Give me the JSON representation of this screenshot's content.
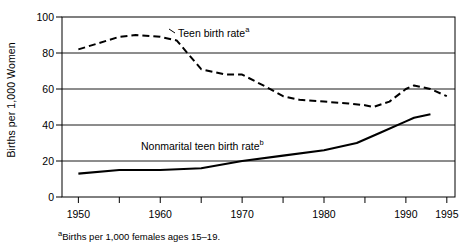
{
  "chart_data": {
    "type": "line",
    "title": "",
    "xlabel": "",
    "ylabel": "Births per 1,000 Women",
    "xlim": [
      1948,
      1996
    ],
    "ylim": [
      0,
      100
    ],
    "grid": true,
    "legend_position": "inline-annotations",
    "yticks": [
      0,
      20,
      40,
      60,
      80,
      100
    ],
    "xticks": [
      1950,
      1955,
      1960,
      1965,
      1970,
      1975,
      1980,
      1985,
      1990,
      1995
    ],
    "xtick_labels_shown": [
      "1950",
      "1960",
      "1970",
      "1980",
      "1990",
      "1995"
    ],
    "series": [
      {
        "name": "Teen birth rate",
        "label": "Teen birth rate",
        "label_superscript": "a",
        "style": "dashed",
        "color": "#000000",
        "x": [
          1950,
          1955,
          1957,
          1960,
          1962,
          1965,
          1968,
          1970,
          1973,
          1975,
          1977,
          1980,
          1983,
          1985,
          1986,
          1988,
          1990,
          1991,
          1993,
          1995
        ],
        "values": [
          82,
          89,
          90,
          89,
          87,
          71,
          68,
          68,
          61,
          56,
          54,
          53,
          52,
          51,
          50,
          53,
          60,
          62,
          60,
          56
        ]
      },
      {
        "name": "Nonmarital teen birth rate",
        "label": "Nonmarital teen birth rate",
        "label_superscript": "b",
        "style": "solid",
        "color": "#000000",
        "x": [
          1950,
          1955,
          1960,
          1965,
          1970,
          1975,
          1980,
          1984,
          1987,
          1990,
          1991,
          1993
        ],
        "values": [
          13,
          15,
          15,
          16,
          20,
          23,
          26,
          30,
          36,
          42,
          44,
          46
        ]
      }
    ],
    "annotations": [
      {
        "text": "Teen birth rate",
        "superscript": "a",
        "x_px": 178,
        "y_px": 25
      },
      {
        "text": "Nonmarital teen birth rate",
        "superscript": "b",
        "x_px": 141,
        "y_px": 138
      }
    ],
    "footnote": {
      "marker": "a",
      "text": "Births per 1,000 females ages 15–19."
    }
  }
}
